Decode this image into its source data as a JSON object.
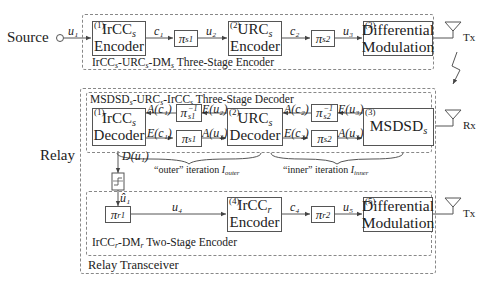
{
  "source": {
    "label": "Source",
    "signal": "u₁"
  },
  "relay_label": "Relay",
  "source_encoder": {
    "title": "IrCC_s-URC_s-DM_s Three-Stage Encoder",
    "blocks": [
      {
        "num": "(1)",
        "line1": "IrCC",
        "line1_sub": "s",
        "line2": "Encoder"
      },
      {
        "num": "(2)",
        "line1": "URC",
        "line1_sub": "s",
        "line2": "Encoder"
      },
      {
        "num": "(3)",
        "line1": "Differential",
        "line2": "Modulation"
      }
    ],
    "interleavers": [
      {
        "symbol": "π",
        "sub": "s1"
      },
      {
        "symbol": "π",
        "sub": "s2"
      }
    ],
    "signals": [
      "c₁",
      "u₂",
      "c₂",
      "u₃"
    ],
    "antenna": "Tx"
  },
  "relay_decoder": {
    "title": "MSDSD_s-URC_s-IrCC_s Three-Stage Decoder",
    "blocks": [
      {
        "num": "(1)",
        "line1": "IrCC",
        "line1_sub": "s",
        "line2": "Decoder"
      },
      {
        "num": "(2)",
        "line1": "URC",
        "line1_sub": "s",
        "line2": "Decoder"
      },
      {
        "num": "(3)",
        "line1": "MSDSD",
        "line1_sub": "s"
      }
    ],
    "interleavers": [
      {
        "symbol": "π",
        "sub": "s1",
        "sup": "−1"
      },
      {
        "symbol": "π",
        "sub": "s1"
      },
      {
        "symbol": "π",
        "sub": "s2",
        "sup": "−1"
      },
      {
        "symbol": "π",
        "sub": "s2"
      }
    ],
    "signals": {
      "a_c1": "A(c₁)",
      "e_u2": "E(u₂)",
      "e_c1": "E(c₁)",
      "a_u2": "A(u₂)",
      "a_c2": "A(c₂)",
      "e_u3": "E(u₃)",
      "e_c2": "E(c₂)",
      "a_u3": "A(u₃)",
      "d_u1": "D(u₁)"
    },
    "outer_iteration": {
      "text": "“outer” iteration ",
      "sym": "I",
      "sup": "r",
      "sub": "outer"
    },
    "inner_iteration": {
      "text": "“inner” iteration ",
      "sym": "I",
      "sup": "r",
      "sub": "inner"
    },
    "antenna": "Rx"
  },
  "relay_encoder": {
    "title": "IrCC_r-DM_r Two-Stage Encoder",
    "blocks": [
      {
        "num": "(4)",
        "line1": "IrCC",
        "line1_sub": "r",
        "line2": "Encoder"
      },
      {
        "num": "(5)",
        "line1": "Differential",
        "line2": "Modulation"
      }
    ],
    "interleavers": [
      {
        "symbol": "π",
        "sub": "r1"
      },
      {
        "symbol": "π",
        "sub": "r2"
      }
    ],
    "signals": [
      "û₁",
      "u₄",
      "c₄",
      "u₅"
    ],
    "antenna": "Tx"
  },
  "relay_transceiver_label": "Relay Transceiver",
  "colors": {
    "line": "#555555",
    "dashed": "#888888",
    "text": "#222222"
  }
}
